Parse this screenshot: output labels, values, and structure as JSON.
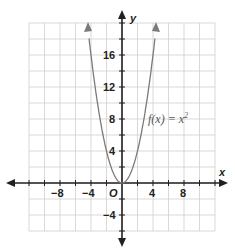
{
  "chart_data": {
    "type": "line",
    "title": "",
    "xlabel": "x",
    "ylabel": "y",
    "xlim": [
      -12,
      12
    ],
    "ylim": [
      -6,
      20
    ],
    "grid": true,
    "x_ticks": [
      -8,
      -4,
      4,
      8
    ],
    "y_ticks": [
      -4,
      4,
      8,
      12,
      16
    ],
    "origin_label": "O",
    "series": [
      {
        "name": "f(x) = x²",
        "function": "x^2",
        "x": [
          -4.2,
          -4,
          -3,
          -2,
          -1,
          0,
          1,
          2,
          3,
          4,
          4.2
        ],
        "y": [
          17.64,
          16,
          9,
          4,
          1,
          0,
          1,
          4,
          9,
          16,
          17.64
        ]
      }
    ],
    "annotations": [
      {
        "text": "f(x) = x²",
        "x": 4,
        "y": 8
      }
    ]
  },
  "labels": {
    "x_axis": "x",
    "y_axis": "y",
    "origin": "O",
    "function": "f(x) = x",
    "exponent": "2",
    "xt": [
      "−8",
      "−4",
      "4",
      "8"
    ],
    "yt": [
      "16",
      "12",
      "8",
      "4",
      "−4"
    ]
  }
}
